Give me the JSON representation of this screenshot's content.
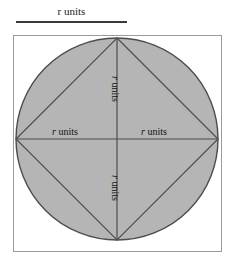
{
  "figure": {
    "name": "circle-inscribed-in-square-with-inscribed-square",
    "scale": {
      "variable": "r",
      "unit_text": " units",
      "full_text": "r units"
    },
    "labels": {
      "left_radius": {
        "variable": "r",
        "unit_text": " units"
      },
      "right_radius": {
        "variable": "r",
        "unit_text": " units"
      },
      "top_radius": {
        "variable": "r",
        "unit_text": " units"
      },
      "bottom_radius": {
        "variable": "r",
        "unit_text": " units"
      }
    },
    "colors": {
      "circle_fill": "#b5b5b5",
      "circle_stroke": "#4d4d4d",
      "box_stroke": "#9a9a9a",
      "diamond_stroke": "#4d4d4d",
      "diameter_stroke": "#4d4d4d",
      "rule_color": "#3a3a3a",
      "background": "#ffffff",
      "text_color": "#111111"
    },
    "geometry": {
      "box": {
        "x": 13,
        "y": 35,
        "width": 209,
        "height": 217
      },
      "circle": {
        "cx": 104,
        "cy": 104,
        "r": 101
      },
      "diamond_vertices": "104,3 205,104 104,205 3,104",
      "vertical_diameter": {
        "x1": 104,
        "y1": 3,
        "x2": 104,
        "y2": 205
      },
      "horizontal_diameter": {
        "x1": 3,
        "y1": 104,
        "x2": 205,
        "y2": 104
      }
    }
  }
}
